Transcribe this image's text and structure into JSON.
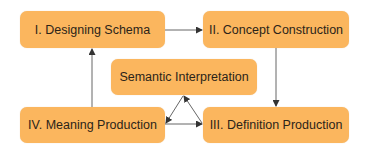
{
  "diagram": {
    "type": "flowchart",
    "colors": {
      "node_fill": "#fbb65e",
      "edge": "#555555",
      "text": "#2b2419",
      "background": "#ffffff"
    },
    "nodes": {
      "n1": {
        "label": "I. Designing Schema"
      },
      "n2": {
        "label": "II. Concept Construction"
      },
      "n3": {
        "label": "III. Definition Production"
      },
      "n4": {
        "label": "IV. Meaning Production"
      },
      "n5": {
        "label": "Semantic Interpretation"
      }
    },
    "edges": [
      {
        "from": "I. Designing Schema",
        "to": "II. Concept Construction"
      },
      {
        "from": "II. Concept Construction",
        "to": "III. Definition Production"
      },
      {
        "from": "IV. Meaning Production",
        "to": "III. Definition Production"
      },
      {
        "from": "IV. Meaning Production",
        "to": "I. Designing Schema"
      },
      {
        "from": "III. Definition Production",
        "to": "Semantic Interpretation"
      },
      {
        "from": "Semantic Interpretation",
        "to": "IV. Meaning Production"
      }
    ]
  }
}
